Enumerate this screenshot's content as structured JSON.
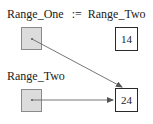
{
  "statement": {
    "lhs": "Range_One",
    "op": ":=",
    "rhs": "Range_Two"
  },
  "variables": [
    {
      "name": "Range_One",
      "kind": "pointer",
      "points_to": 1
    },
    {
      "name": "Range_Two",
      "kind": "pointer",
      "points_to": 1
    }
  ],
  "values": [
    {
      "value": "14"
    },
    {
      "value": "24"
    }
  ],
  "labels": {
    "top_statement": "Range_One  :=  Range_Two",
    "range_two_label": "Range_Two"
  },
  "colors": {
    "pointer_fill": "#dcdcdc",
    "pointer_border": "#8a8a8a",
    "arrow": "#555555",
    "value_border": "#2a2a2a"
  }
}
